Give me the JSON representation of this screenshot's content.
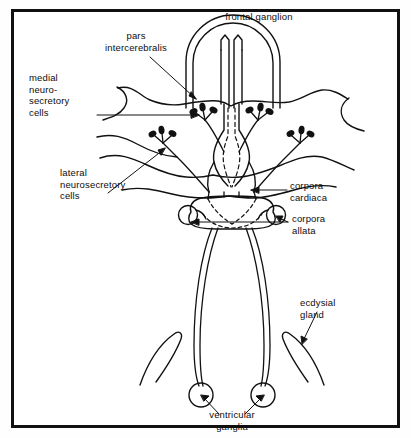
{
  "figure": {
    "domain": "Diagram",
    "background_color": "#ffffff",
    "ink_color": "#111111",
    "border_color": "#111111",
    "border_width_px": 3
  },
  "labels": {
    "frontal_ganglion": "frontal ganglion",
    "pars_intercerebralis": "pars\nintercerebralis",
    "medial_neurosecretory_cells": "medial\nneuro-\nsecretory\ncells",
    "lateral_neurosecretory_cells": "lateral\nneurosecretory\ncells",
    "corpora_cardiaca": "corpora\ncardiaca",
    "corpora_allata": "corpora\nallata",
    "ecdysial_gland": "ecdysial\ngland",
    "ventricular_ganglia": "ventricular\nganglia"
  },
  "structures": [
    {
      "name": "frontal-ganglion",
      "label": "frontal ganglion",
      "description": "double-lined arch above the brain with a central notched stem"
    },
    {
      "name": "pars-intercerebralis",
      "label": "pars intercerebralis",
      "description": "median dorsal brain region receiving the pointer arrow"
    },
    {
      "name": "medial-neurosecretory-cells",
      "label": "medial neuro-secretory cells",
      "description": "paired branching clusters with dark teardrop cell bodies near the midline"
    },
    {
      "name": "lateral-neurosecretory-cells",
      "label": "lateral neurosecretory cells",
      "description": "outer branching clusters with dark teardrop cell bodies"
    },
    {
      "name": "corpora-cardiaca",
      "label": "corpora cardiaca",
      "description": "lobed body below the brain containing dashed internal tracts"
    },
    {
      "name": "corpora-allata",
      "label": "corpora allata",
      "description": "paired rounded knobs lateral to the corpora cardiaca"
    },
    {
      "name": "ecdysial-gland",
      "label": "ecdysial gland",
      "description": "elongated curved crescent glands flanking the nerve cords"
    },
    {
      "name": "ventricular-ganglia",
      "label": "ventricular ganglia",
      "description": "paired circular ganglia at the ends of the recurrent nerve cords"
    }
  ]
}
